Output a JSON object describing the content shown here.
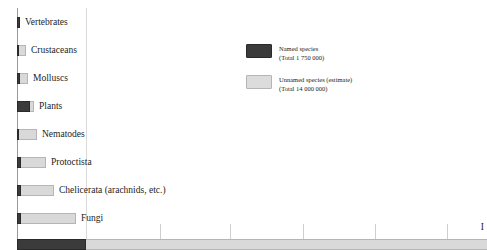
{
  "chart_data": {
    "type": "bar",
    "orientation": "horizontal",
    "stacked": true,
    "title": "",
    "subtitle": "",
    "xlabel": "",
    "ylabel": "",
    "grid": true,
    "legend_position": "center-right",
    "xlim": [
      0,
      2500000
    ],
    "categories": [
      "Vertebrates",
      "Crustaceans",
      "Molluscs",
      "Plants",
      "Nematodes",
      "Protoctista",
      "Chelicerata (arachnids, etc.)",
      "Fungi",
      "Insects"
    ],
    "series": [
      {
        "name": "Named species",
        "color": "#3b3b3b",
        "values": [
          45000,
          40000,
          70000,
          270000,
          25000,
          80000,
          75000,
          72000,
          950000
        ]
      },
      {
        "name": "Unnamed species (estimate)",
        "color": "#d9d9d9",
        "values": [
          5000,
          110000,
          130000,
          50000,
          375000,
          520000,
          675000,
          1128000,
          7050000
        ]
      }
    ],
    "axis_gridline_positions_px": [
      86,
      160,
      230,
      303,
      375,
      447
    ]
  },
  "legend": {
    "items": [
      {
        "swatch": "named",
        "label": "Named species",
        "total": "(Total 1 750 000)"
      },
      {
        "swatch": "unnamed",
        "label": "Unnamed species (estimate)",
        "total": "(Total 14 000 000)"
      }
    ]
  },
  "rows": [
    {
      "label": "Vertebrates",
      "top": 17,
      "named_px": 3,
      "unnamed_px": 0
    },
    {
      "label": "Crustaceans",
      "top": 45,
      "named_px": 2,
      "unnamed_px": 7
    },
    {
      "label": "Molluscs",
      "top": 73,
      "named_px": 3,
      "unnamed_px": 8
    },
    {
      "label": "Plants",
      "top": 101,
      "named_px": 13,
      "unnamed_px": 4
    },
    {
      "label": "Nematodes",
      "top": 129,
      "named_px": 2,
      "unnamed_px": 18
    },
    {
      "label": "Protoctista",
      "top": 157,
      "named_px": 4,
      "unnamed_px": 25
    },
    {
      "label": "Chelicerata (arachnids, etc.)",
      "top": 185,
      "named_px": 4,
      "unnamed_px": 33
    },
    {
      "label": "Fungi",
      "top": 213,
      "named_px": 4,
      "unnamed_px": 55
    }
  ],
  "bottom_row": {
    "label": "I",
    "named_px": 69,
    "unnamed_px": 401
  }
}
